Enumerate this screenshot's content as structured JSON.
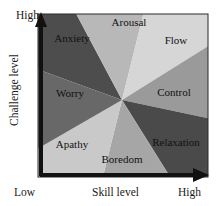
{
  "figure": {
    "background": "#ffffff",
    "plot_area": {
      "x": 38,
      "y": 14,
      "width": 170,
      "height": 163
    },
    "center": {
      "x": 122,
      "y": 100
    }
  },
  "axes": {
    "x": {
      "label": "Skill level",
      "low_label": "Low",
      "high_label": "High",
      "arrow_color": "#111111"
    },
    "y": {
      "label": "Challenge level",
      "low_label": "Low",
      "high_label": "High",
      "arrow_color": "#111111"
    }
  },
  "chart_data": {
    "type": "pie",
    "xlabel": "Skill level",
    "ylabel": "Challenge level",
    "grid": false,
    "legend": "none",
    "note": "Eight radial sectors (octants) drawn from a common center and clipped to the rectangular plot box; sector order is clockwise starting from the upper-left.",
    "categories": [
      "Anxiety",
      "Arousal",
      "Flow",
      "Control",
      "Relaxation",
      "Boredom",
      "Apathy",
      "Worry"
    ],
    "values": [
      45,
      45,
      45,
      45,
      45,
      45,
      45,
      45
    ],
    "slices": [
      {
        "name": "Anxiety",
        "fill": "#4d4d4d",
        "label_fill": "#111111",
        "start_deg": 118,
        "end_deg": 160,
        "label_x": 72,
        "label_y": 42
      },
      {
        "name": "Arousal",
        "fill": "#b8b8b8",
        "label_fill": "#111111",
        "start_deg": 76,
        "end_deg": 118,
        "label_x": 129,
        "label_y": 26
      },
      {
        "name": "Flow",
        "fill": "#d6d6d6",
        "label_fill": "#111111",
        "start_deg": 32,
        "end_deg": 76,
        "label_x": 176,
        "label_y": 44
      },
      {
        "name": "Control",
        "fill": "#9a9a9a",
        "label_fill": "#111111",
        "start_deg": -12,
        "end_deg": 32,
        "label_x": 174,
        "label_y": 96
      },
      {
        "name": "Relaxation",
        "fill": "#4a4a4a",
        "label_fill": "#111111",
        "start_deg": -58,
        "end_deg": -12,
        "label_x": 176,
        "label_y": 146
      },
      {
        "name": "Boredom",
        "fill": "#a6a6a6",
        "label_fill": "#111111",
        "start_deg": -104,
        "end_deg": -58,
        "label_x": 122,
        "label_y": 163
      },
      {
        "name": "Apathy",
        "fill": "#c9c9c9",
        "label_fill": "#111111",
        "start_deg": -150,
        "end_deg": -104,
        "label_x": 72,
        "label_y": 148
      },
      {
        "name": "Worry",
        "fill": "#686868",
        "label_fill": "#111111",
        "start_deg": 160,
        "end_deg": 210,
        "label_x": 70,
        "label_y": 97
      }
    ]
  }
}
